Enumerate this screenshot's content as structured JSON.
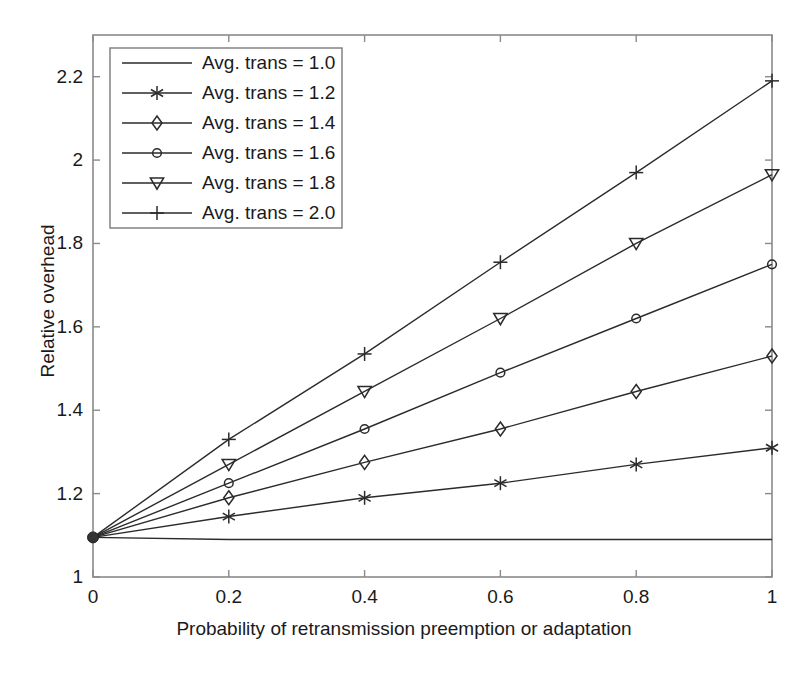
{
  "chart_data": {
    "type": "line",
    "title": "",
    "xlabel": "Probability of retransmission preemption or adaptation",
    "ylabel": "Relative overhead",
    "x": [
      0,
      0.2,
      0.4,
      0.6,
      0.8,
      1
    ],
    "xlim": [
      0,
      1
    ],
    "ylim": [
      1,
      2.3
    ],
    "xticks": [
      "0",
      "0.2",
      "0.4",
      "0.6",
      "0.8",
      "1"
    ],
    "xtick_values": [
      0,
      0.2,
      0.4,
      0.6,
      0.8,
      1
    ],
    "yticks": [
      "1",
      "1.2",
      "1.4",
      "1.6",
      "1.8",
      "2",
      "2.2"
    ],
    "ytick_values": [
      1,
      1.2,
      1.4,
      1.6,
      1.8,
      2,
      2.2
    ],
    "grid": false,
    "legend_position": "upper left",
    "line_color": "#2b2b2b",
    "series": [
      {
        "name": "Avg. trans = 1.0",
        "marker": "none",
        "values": [
          1.095,
          1.09,
          1.09,
          1.09,
          1.09,
          1.09
        ]
      },
      {
        "name": "Avg. trans = 1.2",
        "marker": "asterisk",
        "values": [
          1.095,
          1.145,
          1.19,
          1.225,
          1.27,
          1.31
        ]
      },
      {
        "name": "Avg. trans = 1.4",
        "marker": "diamond",
        "values": [
          1.095,
          1.19,
          1.275,
          1.355,
          1.445,
          1.53
        ]
      },
      {
        "name": "Avg. trans = 1.6",
        "marker": "circle",
        "values": [
          1.095,
          1.225,
          1.355,
          1.49,
          1.62,
          1.75
        ]
      },
      {
        "name": "Avg. trans = 1.8",
        "marker": "triangle-down",
        "values": [
          1.095,
          1.27,
          1.445,
          1.62,
          1.8,
          1.965
        ]
      },
      {
        "name": "Avg. trans = 2.0",
        "marker": "plus",
        "values": [
          1.095,
          1.33,
          1.535,
          1.755,
          1.97,
          2.19
        ]
      }
    ]
  }
}
